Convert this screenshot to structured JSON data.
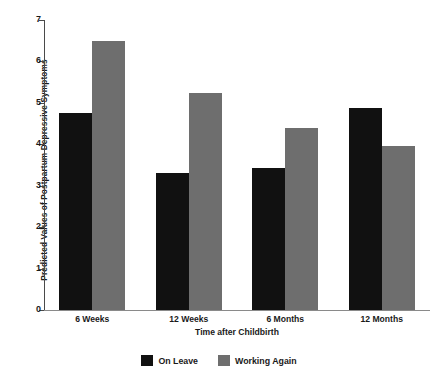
{
  "chart_data": {
    "type": "bar",
    "title": "",
    "xlabel": "Time after Childbirth",
    "ylabel": "Predicted Values of Postpartum Depressive Symptoms",
    "categories": [
      "6 Weeks",
      "12 Weeks",
      "6 Months",
      "12 Months"
    ],
    "series": [
      {
        "name": "On Leave",
        "color": "#111111",
        "values": [
          4.75,
          3.3,
          3.42,
          4.88
        ]
      },
      {
        "name": "Working Again",
        "color": "#6e6e6e",
        "values": [
          6.5,
          5.23,
          4.4,
          3.97
        ]
      }
    ],
    "ylim": [
      0,
      7
    ],
    "yticks": [
      "0",
      "1",
      "2",
      "3",
      "4",
      "5",
      "6",
      "7"
    ],
    "grid": false,
    "legend_position": "bottom"
  }
}
